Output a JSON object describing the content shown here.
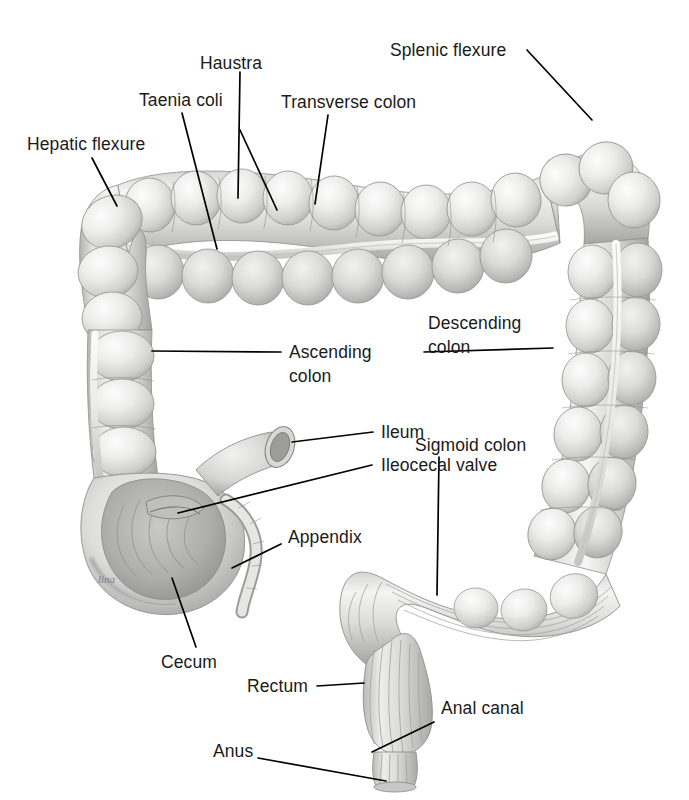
{
  "figure": {
    "background_color": "#ffffff",
    "text_color": "#1a1a1a",
    "leader_color": "#000000",
    "artist_signature": "lina"
  },
  "labels": [
    {
      "id": "hepatic-flexure",
      "text": "Hepatic flexure",
      "lines": [
        "Hepatic flexure"
      ]
    },
    {
      "id": "taenia-coli",
      "text": "Taenia coli",
      "lines": [
        "Taenia coli"
      ]
    },
    {
      "id": "haustra",
      "text": "Haustra",
      "lines": [
        "Haustra"
      ]
    },
    {
      "id": "transverse-colon",
      "text": "Transverse colon",
      "lines": [
        "Transverse colon"
      ]
    },
    {
      "id": "splenic-flexure",
      "text": "Splenic flexure",
      "lines": [
        "Splenic flexure"
      ]
    },
    {
      "id": "ascending-colon",
      "text": "Ascending colon",
      "lines": [
        "Ascending",
        "colon"
      ]
    },
    {
      "id": "descending-colon",
      "text": "Descending colon",
      "lines": [
        "Descending",
        "colon"
      ]
    },
    {
      "id": "ileum",
      "text": "Ileum",
      "lines": [
        "Ileum"
      ]
    },
    {
      "id": "ileocecal-valve",
      "text": "Ileocecal valve",
      "lines": [
        "Ileocecal valve"
      ]
    },
    {
      "id": "sigmoid-colon",
      "text": "Sigmoid colon",
      "lines": [
        "Sigmoid colon"
      ]
    },
    {
      "id": "appendix",
      "text": "Appendix",
      "lines": [
        "Appendix"
      ]
    },
    {
      "id": "cecum",
      "text": "Cecum",
      "lines": [
        "Cecum"
      ]
    },
    {
      "id": "rectum",
      "text": "Rectum",
      "lines": [
        "Rectum"
      ]
    },
    {
      "id": "anal-canal",
      "text": "Anal canal",
      "lines": [
        "Anal canal"
      ]
    },
    {
      "id": "anus",
      "text": "Anus",
      "lines": [
        "Anus"
      ]
    }
  ],
  "label_text": {
    "hepatic_flexure": "Hepatic flexure",
    "taenia_coli": "Taenia coli",
    "haustra": "Haustra",
    "transverse_colon": "Transverse colon",
    "splenic_flexure": "Splenic flexure",
    "ascending_colon_l1": "Ascending",
    "ascending_colon_l2": "colon",
    "descending_colon_l1": "Descending",
    "descending_colon_l2": "colon",
    "ileum": "Ileum",
    "ileocecal_valve": "Ileocecal valve",
    "sigmoid_colon": "Sigmoid colon",
    "appendix": "Appendix",
    "cecum": "Cecum",
    "rectum": "Rectum",
    "anal_canal": "Anal canal",
    "anus": "Anus",
    "signature": "lina"
  }
}
